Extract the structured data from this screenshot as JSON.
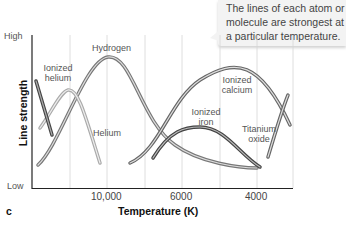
{
  "callout": {
    "text": "The lines of each atom or molecule are strongest at a particular temperature."
  },
  "panel_label": "c",
  "chart_data": {
    "type": "line",
    "title": "",
    "xlabel": "Temperature (K)",
    "ylabel": "Line strength",
    "x_ticks": [
      "10,000",
      "6000",
      "4000"
    ],
    "y_ticks": [
      "High",
      "Low"
    ],
    "x_direction": "decreasing temperature left to right",
    "grid": "vertical",
    "series": [
      {
        "name": "Ionized helium",
        "label": "Ionized\nhelium",
        "peak": "off-scale hottest (left edge)",
        "color": "#555555"
      },
      {
        "name": "Helium",
        "label": "Helium",
        "peak_position": "~ between 20,000 K and 10,000 K",
        "relative_peak": "medium",
        "color": "#bbbbbb"
      },
      {
        "name": "Hydrogen",
        "label": "Hydrogen",
        "peak_position": "~10,000 K",
        "relative_peak": "highest",
        "color": "#888888"
      },
      {
        "name": "Ionized calcium",
        "label": "Ionized\ncalcium",
        "peak_position": "~5000 K",
        "relative_peak": "high",
        "color": "#777777"
      },
      {
        "name": "Ionized iron",
        "label": "Ionized\niron",
        "peak_position": "~5500 K",
        "relative_peak": "medium-low",
        "color": "#555555"
      },
      {
        "name": "Titanium oxide",
        "label": "Titanium\noxide",
        "peak": "rising toward coolest (right edge)",
        "color": "#777777"
      }
    ]
  }
}
